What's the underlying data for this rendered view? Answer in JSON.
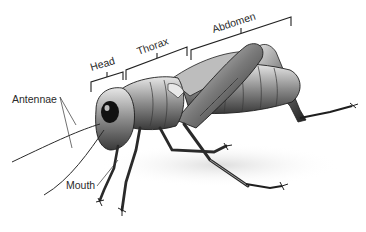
{
  "diagram": {
    "labels": {
      "head": "Head",
      "thorax": "Thorax",
      "abdomen": "Abdomen",
      "antennae": "Antennae",
      "mouth": "Mouth"
    },
    "colors": {
      "ink": "#1e1e1e",
      "label_text": "#2a2a2a",
      "body_mid": "#8a8a8a",
      "body_light": "#d0d0d0",
      "background": "#ffffff"
    }
  }
}
